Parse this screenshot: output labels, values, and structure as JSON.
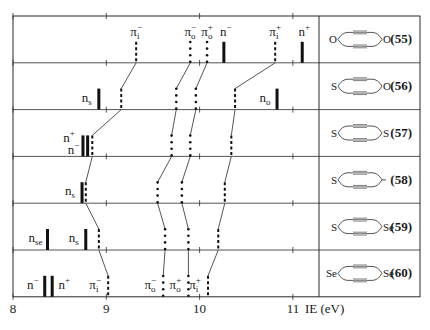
{
  "figure": {
    "x_axis": {
      "label": "IE (eV)",
      "ticks": [
        8,
        9,
        10,
        11
      ],
      "range": [
        8,
        11.85
      ]
    },
    "rows": [
      {
        "compound": "(55)",
        "structure": {
          "left_atom": "O",
          "right_atom": "O",
          "right_type": "ring"
        },
        "levels": [
          {
            "label": "π_i⁻",
            "ie": 9.32,
            "type": "pi-dashed",
            "show_label": true
          },
          {
            "label": "π_o⁻",
            "ie": 9.9,
            "type": "pi-dotted",
            "show_label": true
          },
          {
            "label": "π_o⁺",
            "ie": 10.08,
            "type": "pi-dotted",
            "show_label": true
          },
          {
            "label": "n⁻",
            "ie": 10.26,
            "type": "n-bar",
            "show_label": true
          },
          {
            "label": "π_i⁺",
            "ie": 10.81,
            "type": "pi-dashed",
            "show_label": true
          },
          {
            "label": "n⁺",
            "ie": 11.1,
            "type": "n-bar",
            "show_label": true
          }
        ]
      },
      {
        "compound": "(56)",
        "structure": {
          "left_atom": "S",
          "right_atom": "O",
          "right_type": "ring"
        },
        "levels": [
          {
            "label": "n_s",
            "ie": 8.92,
            "type": "n-bar",
            "show_label": true
          },
          {
            "label": "π_i⁻",
            "ie": 9.16,
            "type": "pi-dashed",
            "show_label": false
          },
          {
            "label": "π_o⁻",
            "ie": 9.75,
            "type": "pi-dotted",
            "show_label": false
          },
          {
            "label": "π_o⁺",
            "ie": 9.96,
            "type": "pi-dotted",
            "show_label": false
          },
          {
            "label": "π_i⁺",
            "ie": 10.38,
            "type": "pi-dashed",
            "show_label": false
          },
          {
            "label": "n_o",
            "ie": 10.83,
            "type": "n-bar",
            "show_label": true
          }
        ]
      },
      {
        "compound": "(57)",
        "structure": {
          "left_atom": "S",
          "right_atom": "S",
          "right_type": "ring"
        },
        "levels": [
          {
            "label": "n⁺",
            "ie": 8.75,
            "type": "n-bar",
            "show_label": true
          },
          {
            "label": "n⁻",
            "ie": 8.8,
            "type": "n-bar",
            "show_label": true
          },
          {
            "label": "π_i⁻",
            "ie": 8.85,
            "type": "pi-dashed",
            "show_label": false
          },
          {
            "label": "π_o⁻",
            "ie": 9.7,
            "type": "pi-dotted",
            "show_label": false
          },
          {
            "label": "π_o⁺",
            "ie": 9.9,
            "type": "pi-dotted",
            "show_label": false
          },
          {
            "label": "π_i⁺",
            "ie": 10.34,
            "type": "pi-dashed",
            "show_label": false
          }
        ]
      },
      {
        "compound": "(58)",
        "structure": {
          "left_atom": "S",
          "right_atom": "",
          "right_type": "carbocycle"
        },
        "levels": [
          {
            "label": "n_s",
            "ie": 8.74,
            "type": "n-bar",
            "show_label": true
          },
          {
            "label": "π_i⁻",
            "ie": 8.78,
            "type": "pi-dashed",
            "show_label": false
          },
          {
            "label": "π_o⁻",
            "ie": 9.55,
            "type": "pi-dotted",
            "show_label": false
          },
          {
            "label": "π_o⁺",
            "ie": 9.81,
            "type": "pi-dotted",
            "show_label": false
          },
          {
            "label": "π_i⁺",
            "ie": 10.27,
            "type": "pi-dashed",
            "show_label": false
          }
        ]
      },
      {
        "compound": "(59)",
        "structure": {
          "left_atom": "S",
          "right_atom": "Se",
          "right_type": "ring"
        },
        "levels": [
          {
            "label": "n_se",
            "ie": 8.37,
            "type": "n-bar",
            "show_label": true
          },
          {
            "label": "n_s",
            "ie": 8.78,
            "type": "n-bar",
            "show_label": true
          },
          {
            "label": "π_i⁻",
            "ie": 8.92,
            "type": "pi-dashed",
            "show_label": false
          },
          {
            "label": "π_o⁻",
            "ie": 9.63,
            "type": "pi-dotted",
            "show_label": false
          },
          {
            "label": "π_o⁺",
            "ie": 9.88,
            "type": "pi-dotted",
            "show_label": false
          },
          {
            "label": "π_i⁺",
            "ie": 10.2,
            "type": "pi-dashed",
            "show_label": false
          }
        ]
      },
      {
        "compound": "(60)",
        "structure": {
          "left_atom": "Se",
          "right_atom": "Se",
          "right_type": "ring"
        },
        "levels": [
          {
            "label": "n⁻",
            "ie": 8.34,
            "type": "n-bar",
            "show_label": true
          },
          {
            "label": "n⁺",
            "ie": 8.42,
            "type": "n-bar",
            "show_label": true
          },
          {
            "label": "π_i⁻",
            "ie": 9.02,
            "type": "pi-dashed",
            "show_label": true
          },
          {
            "label": "π_o⁻",
            "ie": 9.61,
            "type": "pi-dotted",
            "show_label": true
          },
          {
            "label": "π_o⁺",
            "ie": 9.88,
            "type": "pi-dotted",
            "show_label": true
          },
          {
            "label": "π_i⁺",
            "ie": 10.09,
            "type": "pi-dashed",
            "show_label": true
          }
        ]
      }
    ],
    "correlations": [
      "π_i⁻",
      "π_o⁻",
      "π_o⁺",
      "π_i⁺"
    ]
  }
}
